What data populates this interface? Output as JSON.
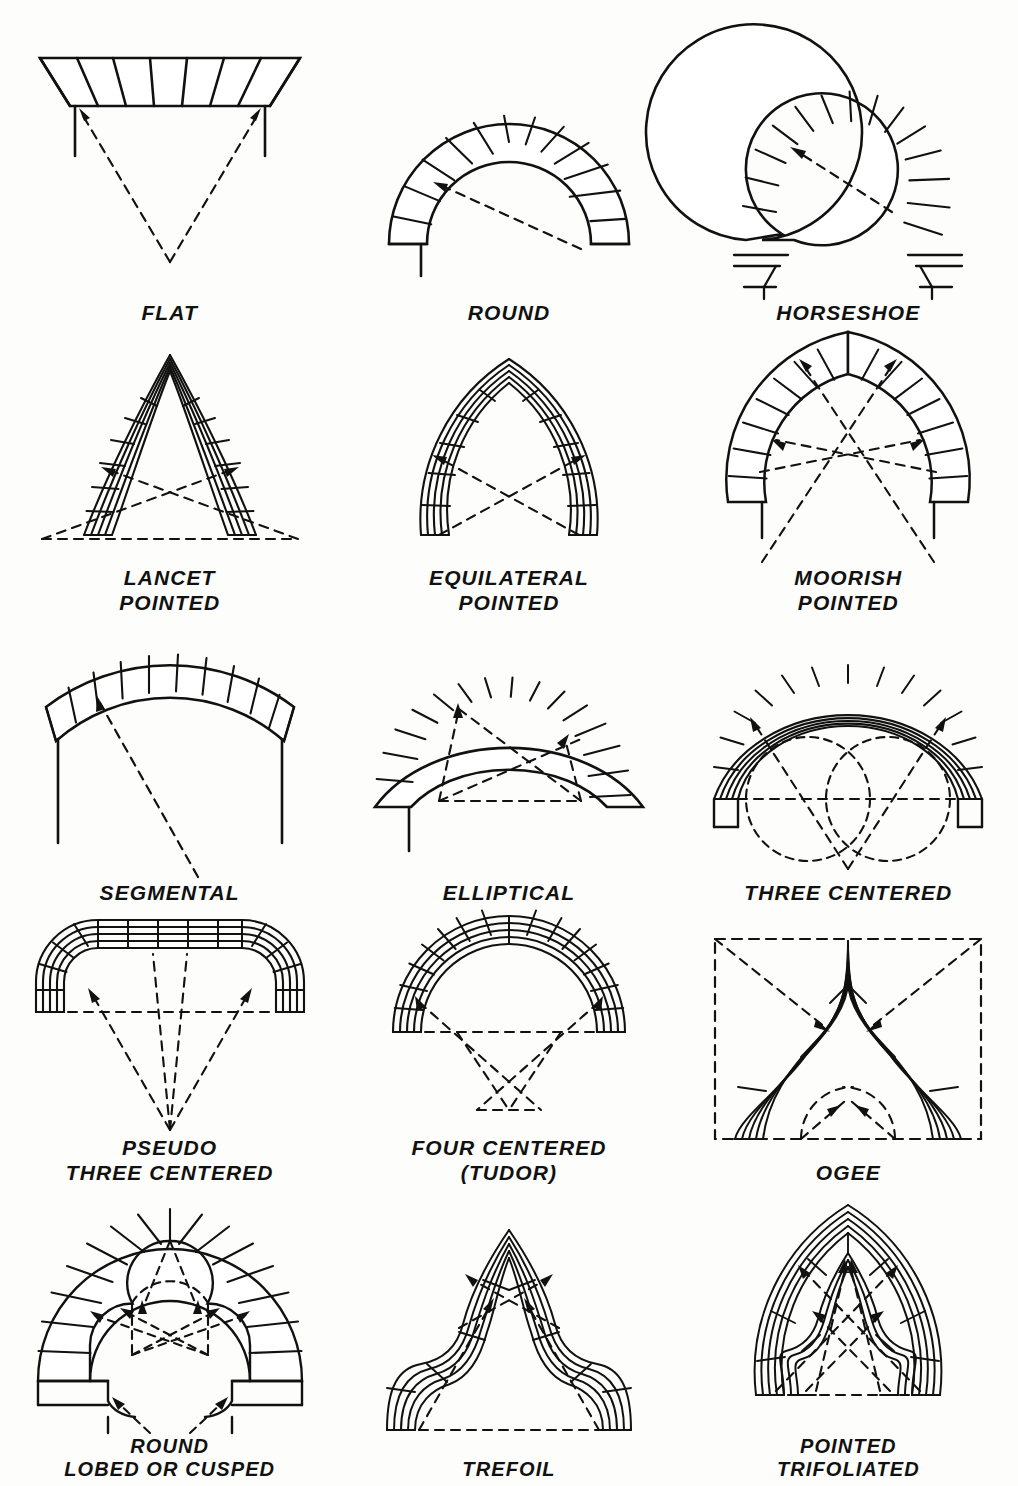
{
  "sheet": {
    "title": "Types of Arches",
    "background_color": "#fdfdfb",
    "ink_color": "#111111",
    "columns": 3,
    "rows": 5,
    "total_figures": 15
  },
  "figures": [
    {
      "id": "flat",
      "label": "FLAT",
      "row": 1,
      "col": 1,
      "centers": 1,
      "voussoirs": 8,
      "rings": 1,
      "construction_lines": "two dashed radii converging to a single center below the arch"
    },
    {
      "id": "round",
      "label": "ROUND",
      "row": 1,
      "col": 2,
      "centers": 1,
      "voussoirs": 15,
      "rings": 1,
      "construction_lines": "single dashed radius to center at springing line"
    },
    {
      "id": "horseshoe",
      "label": "HORSESHOE",
      "row": 1,
      "col": 3,
      "centers": 1,
      "voussoirs": 19,
      "rings": 1,
      "construction_lines": "single dashed radius to center above springing line"
    },
    {
      "id": "lancet-pointed",
      "label": "LANCET\nPOINTED",
      "row": 2,
      "col": 1,
      "centers": 2,
      "voussoirs": 18,
      "rings": 4,
      "construction_lines": "two dashed radii crossing, centers outside the span"
    },
    {
      "id": "equilateral-pointed",
      "label": "EQUILATERAL\nPOINTED",
      "row": 2,
      "col": 2,
      "centers": 2,
      "voussoirs": 16,
      "rings": 4,
      "construction_lines": "two dashed radii crossing, centers at opposite springing points"
    },
    {
      "id": "moorish-pointed",
      "label": "MOORISH\nPOINTED",
      "row": 2,
      "col": 3,
      "centers": 4,
      "voussoirs": 20,
      "rings": 1,
      "construction_lines": "four dashed radii crossing below the springing line"
    },
    {
      "id": "segmental",
      "label": "SEGMENTAL",
      "row": 3,
      "col": 1,
      "centers": 1,
      "voussoirs": 13,
      "rings": 1,
      "construction_lines": "one dashed radius to a center far below the springing line"
    },
    {
      "id": "elliptical",
      "label": "ELLIPTICAL",
      "row": 3,
      "col": 2,
      "centers": 3,
      "voussoirs": 17,
      "rings": 1,
      "construction_lines": "three dashed radii from two low centers crossing"
    },
    {
      "id": "three-centered",
      "label": "THREE CENTERED",
      "row": 3,
      "col": 3,
      "centers": 3,
      "voussoirs": 18,
      "rings": 3,
      "construction_lines": "two dashed setting-out circles plus crossing radii and a horizontal springing line"
    },
    {
      "id": "pseudo-three-centered",
      "label": "PSEUDO\nTHREE CENTERED",
      "row": 4,
      "col": 1,
      "centers": 4,
      "voussoirs": 20,
      "rings": 3,
      "construction_lines": "four dashed radii converging to one point low below the arch"
    },
    {
      "id": "four-centered",
      "label": "FOUR CENTERED\n(TUDOR)",
      "row": 4,
      "col": 2,
      "centers": 4,
      "voussoirs": 20,
      "rings": 3,
      "construction_lines": "dashed springing line with two crossing radii meeting below"
    },
    {
      "id": "ogee",
      "label": "OGEE",
      "row": 4,
      "col": 3,
      "centers": 4,
      "voussoirs": 10,
      "rings": 5,
      "construction_lines": "dashed bounding rectangle, diagonal radii and inner reverse-curve arcs"
    },
    {
      "id": "round-lobed-cusped",
      "label": "ROUND\nLOBED OR CUSPED",
      "row": 5,
      "col": 1,
      "centers": 5,
      "voussoirs": 17,
      "rings": 1,
      "construction_lines": "dashed lobe circles with crossing radii to three lobe centers"
    },
    {
      "id": "trefoil",
      "label": "TREFOIL",
      "row": 5,
      "col": 2,
      "centers": 3,
      "voussoirs": 14,
      "rings": 5,
      "construction_lines": "dashed springing line with radii to the three foil centers"
    },
    {
      "id": "pointed-trifoliated",
      "label": "POINTED\nTRIFOLIATED",
      "row": 5,
      "col": 3,
      "centers": 6,
      "voussoirs": 20,
      "rings": 5,
      "construction_lines": "dashed springing line with multiple crossing radii to foil and arch centers"
    }
  ]
}
